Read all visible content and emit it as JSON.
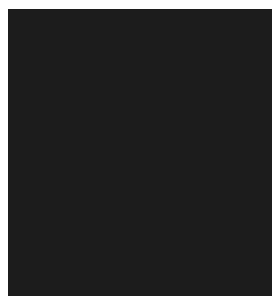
{
  "image": {
    "description": "Grayscale long-exposure frame with faint vertical streaks on dark background",
    "frame": {
      "left": 8,
      "top": 9,
      "width": 264,
      "height": 287
    },
    "background_colors": {
      "page": "#ffffff",
      "upper_band": "#020202",
      "lower_band": "#1d1d1d"
    },
    "upper_band_height": 80,
    "streaks": [
      {
        "x": 14,
        "y": 36,
        "length": 75,
        "width": 2,
        "peak_opacity": 0.45
      },
      {
        "x": 41,
        "y": 6,
        "length": 26,
        "width": 1,
        "peak_opacity": 0.35
      },
      {
        "x": 221,
        "y": 6,
        "length": 115,
        "width": 2,
        "peak_opacity": 0.55
      },
      {
        "x": 132,
        "y": 106,
        "length": 172,
        "width": 2,
        "peak_opacity": 0.6
      },
      {
        "x": 240,
        "y": 150,
        "length": 132,
        "width": 2,
        "peak_opacity": 0.5
      },
      {
        "x": 83,
        "y": 196,
        "length": 26,
        "width": 1,
        "peak_opacity": 0.5
      }
    ]
  }
}
